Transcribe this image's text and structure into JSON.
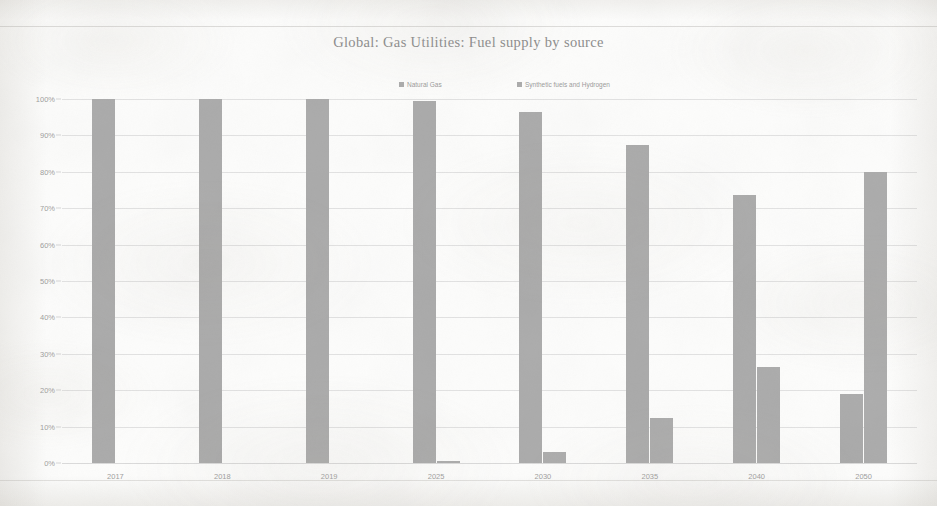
{
  "document": {
    "background_color": "#fdfdfc",
    "paper_tone": "#f6f5f2"
  },
  "chart_data": {
    "type": "bar",
    "title": "Global: Gas Utilities: Fuel supply by source",
    "xlabel": "",
    "ylabel": "",
    "ylim": [
      0,
      100
    ],
    "y_tick_labels": [
      "0%",
      "10%",
      "20%",
      "30%",
      "40%",
      "50%",
      "60%",
      "70%",
      "80%",
      "90%",
      "100%"
    ],
    "y_tick_values": [
      0,
      10,
      20,
      30,
      40,
      50,
      60,
      70,
      80,
      90,
      100
    ],
    "grid": true,
    "legend_position": "top-center",
    "categories": [
      "2017",
      "2018",
      "2019",
      "2025",
      "2030",
      "2035",
      "2040",
      "2050"
    ],
    "series": [
      {
        "name": "Natural Gas",
        "color": "#aaaaaa",
        "values": [
          100,
          100,
          100,
          99.5,
          96.5,
          87.5,
          73.5,
          19
        ]
      },
      {
        "name": "Synthetic fuels and Hydrogen",
        "color": "#ababab",
        "values": [
          0,
          0,
          0,
          0.5,
          3,
          12.5,
          26.5,
          80
        ]
      }
    ]
  },
  "legend": {
    "items": [
      {
        "label": "Natural Gas",
        "marker": "legend-swatch-icon"
      },
      {
        "label": "Synthetic fuels and Hydrogen",
        "marker": "legend-swatch-icon"
      }
    ]
  }
}
